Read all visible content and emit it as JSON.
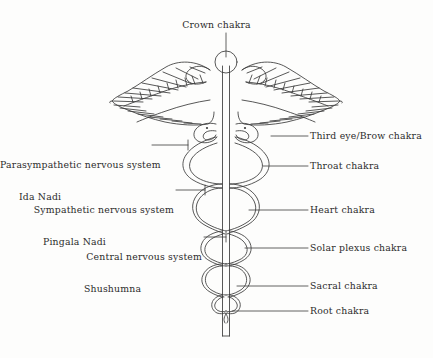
{
  "figure": {
    "title_label": "Crown chakra",
    "background_color": "#fdfdfc",
    "line_color": "#3a3a3a",
    "text_color": "#2b2b2b"
  },
  "labels": {
    "top": [
      {
        "id": "crown",
        "text": "Crown chakra",
        "side": "top"
      }
    ],
    "left": [
      {
        "id": "parasympathetic",
        "line1": "Parasympathetic nervous system",
        "line2": "Ida Nadi"
      },
      {
        "id": "sympathetic",
        "line1": "Sympathetic nervous system",
        "line2": "Pingala Nadi"
      },
      {
        "id": "central",
        "line1": "Central nervous system",
        "line2": "Shushumna"
      }
    ],
    "right": [
      {
        "id": "third-eye",
        "text": "Third eye/Brow chakra"
      },
      {
        "id": "throat",
        "text": "Throat chakra"
      },
      {
        "id": "heart",
        "text": "Heart chakra"
      },
      {
        "id": "solar-plexus",
        "text": "Solar plexus chakra"
      },
      {
        "id": "sacral",
        "text": "Sacral chakra"
      },
      {
        "id": "root",
        "text": "Root chakra"
      }
    ]
  }
}
